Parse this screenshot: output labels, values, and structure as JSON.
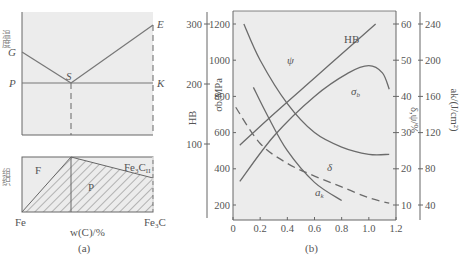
{
  "panel_a": {
    "caption": "(a)",
    "top": {
      "ylabel": "温度",
      "points": {
        "G": "G",
        "E": "E",
        "P": "P",
        "S": "S",
        "K": "K"
      }
    },
    "bottom": {
      "ylabel": "组织",
      "regions": {
        "F": "F",
        "P": "P",
        "Fe3C_base": "Fe",
        "Fe3C_sub": "3",
        "Fe3C_C": "C",
        "Fe3C_II": "II"
      },
      "x_left": "Fe",
      "x_right_base": "Fe",
      "x_right_sub": "3",
      "x_right_C": "C",
      "xlabel": "w(C)/%"
    }
  },
  "panel_b": {
    "caption": "(b)",
    "chart_data": {
      "type": "line",
      "xlabel": "",
      "x_ticks": [
        "0",
        "0.2",
        "0.4",
        "0.6",
        "0.8",
        "1.0",
        "1.2"
      ],
      "xlim": [
        0,
        1.2
      ],
      "axes": {
        "HB": {
          "label": "HB",
          "ticks": [
            "300",
            "200",
            "100"
          ],
          "range": [
            100,
            300
          ]
        },
        "sigma_b": {
          "label": "σb/MPa",
          "ticks": [
            "1200",
            "1000",
            "800",
            "600",
            "400",
            "200"
          ],
          "range": [
            200,
            1200
          ]
        },
        "delta_psi": {
          "label": "δ,ψ/%",
          "ticks": [
            "60",
            "50",
            "40",
            "30",
            "20",
            "10"
          ],
          "range": [
            10,
            60
          ]
        },
        "a_k": {
          "label": "ak/(J/cm²)",
          "ticks": [
            "240",
            "200",
            "160",
            "120",
            "80",
            "40"
          ],
          "range": [
            40,
            240
          ]
        }
      },
      "series": [
        {
          "name": "HB",
          "label": "HB",
          "axis": "HB",
          "x": [
            0.05,
            0.3,
            0.6,
            0.9,
            1.05
          ],
          "y": [
            98,
            150,
            210,
            270,
            300
          ]
        },
        {
          "name": "sigma_b",
          "label": "σb",
          "axis": "sigma_b",
          "x": [
            0.05,
            0.3,
            0.6,
            0.85,
            1.0,
            1.1,
            1.15
          ],
          "y": [
            330,
            580,
            800,
            930,
            970,
            930,
            840
          ]
        },
        {
          "name": "psi",
          "label": "ψ",
          "axis": "delta_psi",
          "x": [
            0.08,
            0.2,
            0.4,
            0.6,
            0.8,
            1.0,
            1.15
          ],
          "y": [
            60,
            50,
            38,
            30,
            26,
            24,
            24
          ]
        },
        {
          "name": "delta",
          "label": "δ",
          "axis": "delta_psi",
          "x": [
            0.02,
            0.2,
            0.4,
            0.6,
            0.8,
            1.0,
            1.15
          ],
          "y": [
            37,
            27,
            21.5,
            18,
            15,
            12,
            10.5
          ]
        },
        {
          "name": "a_k",
          "label": "ak",
          "axis": "a_k",
          "x": [
            0.15,
            0.25,
            0.4,
            0.6,
            0.8
          ],
          "y": [
            170,
            140,
            100,
            65,
            45
          ]
        }
      ],
      "labels": {
        "HB": "HB",
        "psi": "ψ",
        "sigma": "σ",
        "sigma_sub": "b",
        "delta": "δ",
        "a": "a",
        "a_sub": "k"
      }
    }
  }
}
